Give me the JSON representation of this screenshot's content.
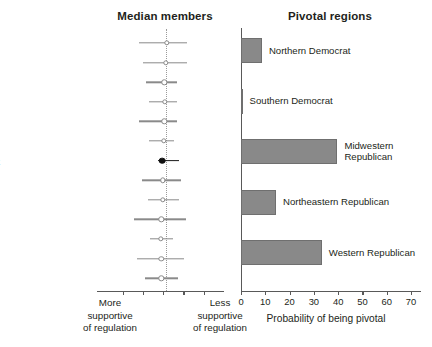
{
  "figure": {
    "width": 432,
    "height": 347,
    "bar_color": "#898989",
    "marker_color": "#8a8a8a",
    "pivot_color": "#111111"
  },
  "left_panel": {
    "title": "Median members",
    "axis_caption_left": "More\nsupportive\nof regulation",
    "axis_caption_left_lines": [
      "More",
      "supportive",
      "of regulation"
    ],
    "axis_caption_right_lines": [
      "Less",
      "supportive",
      "of regulation"
    ],
    "reference_line_value": 0.0
  },
  "right_panel": {
    "title": "Pivotal regions",
    "xlabel": "Probability of being pivotal"
  },
  "chart_data": [
    {
      "type": "scatter",
      "subtype": "forest-plot",
      "title": "Median members",
      "xlabel": "",
      "ylabel": "",
      "xlim": [
        -1.0,
        1.0
      ],
      "xticks": [
        -0.75,
        -0.4,
        -0.05,
        0.3,
        0.65
      ],
      "xtick_labels": [
        "",
        "",
        "",
        "",
        ""
      ],
      "grid": false,
      "reference_line": 0.0,
      "axis_annotations": {
        "left": "More supportive of regulation",
        "right": "Less supportive of regulation"
      },
      "categories": [
        "Clapp (R MN)",
        "Kittredge (R SD)",
        "Clark (R WY)",
        "Nelson (R MN)",
        "Hopkins (R IL)",
        "Warren (R WY)",
        "Median pivot",
        "Brandegee (R CT)",
        "Perkins (R CA)",
        "Mitchell (R OR)",
        "Carter (R MT)",
        "Benson (R KS)",
        "Gamble (R SD)"
      ],
      "points": [
        {
          "label": "Clapp (R MN)",
          "estimate": 0.01,
          "ci_low": -0.46,
          "ci_high": 0.36,
          "marker": "open"
        },
        {
          "label": "Kittredge (R SD)",
          "estimate": 0.0,
          "ci_low": -0.4,
          "ci_high": 0.36,
          "marker": "open"
        },
        {
          "label": "Clark (R WY)",
          "estimate": -0.03,
          "ci_low": -0.34,
          "ci_high": 0.19,
          "marker": "open"
        },
        {
          "label": "Nelson (R MN)",
          "estimate": -0.02,
          "ci_low": -0.3,
          "ci_high": 0.19,
          "marker": "open"
        },
        {
          "label": "Hopkins (R IL)",
          "estimate": -0.03,
          "ci_low": -0.47,
          "ci_high": 0.19,
          "marker": "open"
        },
        {
          "label": "Warren (R WY)",
          "estimate": -0.04,
          "ci_low": -0.29,
          "ci_high": 0.13,
          "marker": "open"
        },
        {
          "label": "Median pivot",
          "estimate": -0.07,
          "ci_low": -0.13,
          "ci_high": 0.22,
          "marker": "filled"
        },
        {
          "label": "Brandegee (R CT)",
          "estimate": -0.05,
          "ci_low": -0.41,
          "ci_high": 0.26,
          "marker": "open"
        },
        {
          "label": "Perkins (R CA)",
          "estimate": -0.05,
          "ci_low": -0.31,
          "ci_high": 0.23,
          "marker": "open"
        },
        {
          "label": "Mitchell (R OR)",
          "estimate": -0.08,
          "ci_low": -0.55,
          "ci_high": 0.35,
          "marker": "open"
        },
        {
          "label": "Carter (R MT)",
          "estimate": -0.09,
          "ci_low": -0.28,
          "ci_high": 0.12,
          "marker": "open"
        },
        {
          "label": "Benson (R KS)",
          "estimate": -0.08,
          "ci_low": -0.5,
          "ci_high": 0.31,
          "marker": "open"
        },
        {
          "label": "Gamble (R SD)",
          "estimate": -0.08,
          "ci_low": -0.37,
          "ci_high": 0.2,
          "marker": "open"
        }
      ]
    },
    {
      "type": "bar",
      "orientation": "horizontal",
      "title": "Pivotal regions",
      "xlabel": "Probability of being pivotal",
      "ylabel": "",
      "xlim": [
        0,
        73
      ],
      "xticks": [
        0,
        10,
        20,
        30,
        40,
        50,
        60,
        70
      ],
      "xtick_labels": [
        "0",
        "10",
        "20",
        "30",
        "40",
        "50",
        "60",
        "70"
      ],
      "grid": false,
      "legend": "none",
      "categories": [
        "Northern Democrat",
        "Southern Democrat",
        "Midwestern Republican",
        "Northeastern Republican",
        "Western Republican"
      ],
      "category_label_lines": [
        [
          "Northern Democrat"
        ],
        [
          "Southern Democrat"
        ],
        [
          "Midwestern",
          "Republican"
        ],
        [
          "Northeastern Republican"
        ],
        [
          "Western Republican"
        ]
      ],
      "values": [
        8.6,
        0.6,
        39.7,
        14.4,
        33.3
      ]
    }
  ]
}
